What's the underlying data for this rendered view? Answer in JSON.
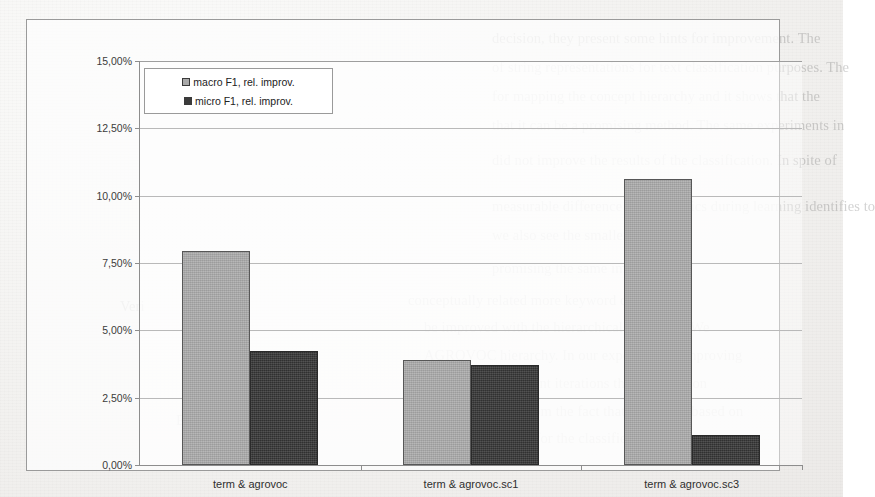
{
  "chart_data": {
    "type": "bar",
    "title": "",
    "xlabel": "",
    "ylabel": "",
    "categories": [
      "term & agrovoc",
      "term & agrovoc.sc1",
      "term & agrovoc.sc3"
    ],
    "series": [
      {
        "name": "macro F1, rel. improv.",
        "color": "#a9a9a9",
        "values": [
          7.95,
          3.9,
          10.62
        ]
      },
      {
        "name": "micro F1, rel. improv.",
        "color": "#3b3b3b",
        "values": [
          4.22,
          3.72,
          1.1
        ]
      }
    ],
    "ylim": [
      0,
      15
    ],
    "ytick_values": [
      0,
      2.5,
      5,
      7.5,
      10,
      12.5,
      15
    ],
    "ytick_labels": [
      "0,00%",
      "2,50%",
      "5,00%",
      "7,50%",
      "10,00%",
      "12,50%",
      "15,00%"
    ],
    "grid": true,
    "legend_position": "upper-left-inside"
  },
  "legend": {
    "entries": [
      {
        "label": "macro F1, rel. improv."
      },
      {
        "label": "micro F1, rel. improv."
      }
    ]
  },
  "background_text": {
    "lines": [
      {
        "text": "decision, they present some hints for improvement. The",
        "x": 492,
        "y": 28
      },
      {
        "text": "of string representations for text classification purposes. The",
        "x": 492,
        "y": 57
      },
      {
        "text": "for mapping the concept hierarchy and it shows that the",
        "x": 492,
        "y": 86
      },
      {
        "text": "that it can be a promising method. The same experiments in",
        "x": 492,
        "y": 115
      },
      {
        "text": "did not improve the results of the classification. In spite of",
        "x": 492,
        "y": 150
      },
      {
        "text": "measurable difference of the metrics during learning identifies to",
        "x": 492,
        "y": 196
      },
      {
        "text": "we also see the smaller relevance",
        "x": 492,
        "y": 225
      },
      {
        "text": "promising the same improvement",
        "x": 492,
        "y": 258
      },
      {
        "text": "conceptually related more keyword derived",
        "x": 408,
        "y": 290
      },
      {
        "text": "be improved with the hierarchical extension. We",
        "x": 424,
        "y": 317
      },
      {
        "text": "AGROVOC hierarchy. In our experiments, improving",
        "x": 424,
        "y": 345
      },
      {
        "text": "of several subsequent iterations the contribution",
        "x": 424,
        "y": 373
      },
      {
        "text": "may be deduced from the fact that the model based on",
        "x": 424,
        "y": 401
      },
      {
        "text": "the search space for the classifier, the smaller",
        "x": 436,
        "y": 428
      },
      {
        "text": "Veri",
        "x": 120,
        "y": 296
      },
      {
        "text": "Esort",
        "x": 176,
        "y": 410
      }
    ]
  }
}
